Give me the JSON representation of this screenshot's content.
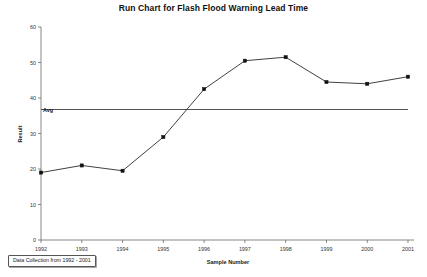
{
  "chart_data": {
    "type": "line",
    "title": "Run Chart for Flash Flood Warning Lead Time",
    "xlabel": "Sample Number",
    "ylabel": "Result",
    "categories": [
      "1992",
      "1993",
      "1994",
      "1995",
      "1996",
      "1997",
      "1998",
      "1999",
      "2000",
      "2001"
    ],
    "values": [
      19,
      21,
      19.5,
      29,
      42.5,
      50.5,
      51.5,
      44.5,
      44,
      46
    ],
    "series": [
      {
        "name": "Result",
        "values": [
          19,
          21,
          19.5,
          29,
          42.5,
          50.5,
          51.5,
          44.5,
          44,
          46
        ]
      }
    ],
    "reference_line": {
      "label": "Avg",
      "value": 36.75
    },
    "ylim": [
      0,
      60
    ],
    "yticks": [
      0,
      10,
      20,
      30,
      40,
      50,
      60
    ],
    "ytick_labels": [
      "0",
      "10",
      "20",
      "30",
      "40",
      "50",
      "60"
    ],
    "xtick_labels": [
      "1992",
      "1993",
      "1994",
      "1995",
      "1996",
      "1997",
      "1998",
      "1999",
      "2000",
      "2001"
    ],
    "grid": false,
    "legend": "none",
    "marker": "square",
    "line_color": "#2b2b2b",
    "avg_color": "#555555"
  },
  "footnote": {
    "text": "Data Collection from 1992 - 2001"
  }
}
